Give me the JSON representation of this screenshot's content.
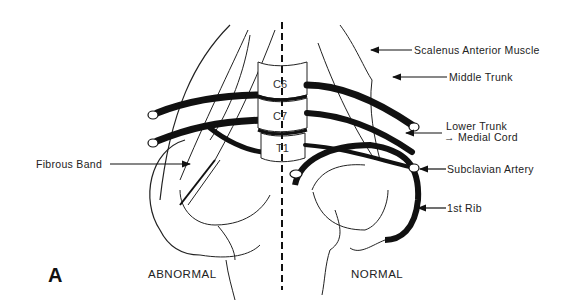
{
  "figure": {
    "panel_letter": "A",
    "captions": {
      "left": "ABNORMAL",
      "right": "NORMAL"
    },
    "vertebrae": [
      "C6",
      "C7",
      "T1"
    ],
    "labels": {
      "scalenus_anterior": "Scalenus Anterior Muscle",
      "middle_trunk": "Middle Trunk",
      "lower_trunk": "Lower Trunk",
      "medial_cord": "→ Medial Cord",
      "subclavian_artery": "Subclavian Artery",
      "first_rib": "1st Rib",
      "fibrous_band": "Fibrous Band"
    },
    "colors": {
      "ink": "#111111",
      "background": "#ffffff"
    }
  }
}
